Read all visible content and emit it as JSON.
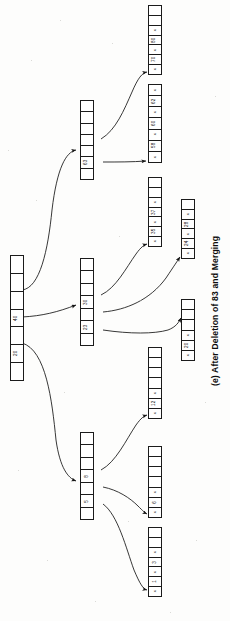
{
  "figure": {
    "caption": "(e) After Deletion of 83 and Merging",
    "kind": "b-plus-tree-diagram",
    "orientation": "rotated-90-ccw",
    "ink_color": "#1b1b1b",
    "paper_color": "#fdfdfc"
  },
  "nodes": {
    "root": {
      "name": "root-node",
      "cells": [
        {
          "type": "pointer",
          "label": ""
        },
        {
          "type": "pointer",
          "label": ""
        },
        {
          "type": "pointer",
          "label": ""
        },
        {
          "type": "key",
          "label": "40"
        },
        {
          "type": "pointer",
          "label": ""
        },
        {
          "type": "key",
          "label": "20"
        },
        {
          "type": "pointer",
          "label": ""
        }
      ]
    },
    "internal_63": {
      "name": "internal-node-63",
      "cells": [
        {
          "type": "pointer",
          "label": ""
        },
        {
          "type": "pointer",
          "label": ""
        },
        {
          "type": "pointer",
          "label": ""
        },
        {
          "type": "pointer",
          "label": ""
        },
        {
          "type": "pointer",
          "label": ""
        },
        {
          "type": "key",
          "label": "63"
        },
        {
          "type": "pointer",
          "label": ""
        }
      ]
    },
    "internal_30_23": {
      "name": "internal-node-30-23",
      "cells": [
        {
          "type": "pointer",
          "label": ""
        },
        {
          "type": "pointer",
          "label": ""
        },
        {
          "type": "pointer",
          "label": ""
        },
        {
          "type": "key",
          "label": "30"
        },
        {
          "type": "pointer",
          "label": ""
        },
        {
          "type": "key",
          "label": "23"
        },
        {
          "type": "pointer",
          "label": ""
        }
      ]
    },
    "internal_8_5": {
      "name": "internal-node-8-5",
      "cells": [
        {
          "type": "pointer",
          "label": ""
        },
        {
          "type": "pointer",
          "label": ""
        },
        {
          "type": "pointer",
          "label": ""
        },
        {
          "type": "key",
          "label": "8"
        },
        {
          "type": "pointer",
          "label": ""
        },
        {
          "type": "key",
          "label": "5"
        },
        {
          "type": "pointer",
          "label": ""
        }
      ]
    },
    "leaf_80_70": {
      "name": "leaf-node-80-70",
      "cells": [
        {
          "type": "empty",
          "label": ""
        },
        {
          "type": "empty",
          "label": ""
        },
        {
          "type": "x",
          "label": "x"
        },
        {
          "type": "key",
          "label": "80"
        },
        {
          "type": "x",
          "label": "x"
        },
        {
          "type": "key",
          "label": "70"
        },
        {
          "type": "x",
          "label": "x"
        }
      ]
    },
    "leaf_62_60_58": {
      "name": "leaf-node-62-60-58",
      "cells": [
        {
          "type": "x",
          "label": "x"
        },
        {
          "type": "key",
          "label": "62"
        },
        {
          "type": "x",
          "label": "x"
        },
        {
          "type": "key",
          "label": "60"
        },
        {
          "type": "x",
          "label": "x"
        },
        {
          "type": "key",
          "label": "58"
        },
        {
          "type": "x",
          "label": "x"
        }
      ]
    },
    "leaf_37_35": {
      "name": "leaf-node-37-35",
      "cells": [
        {
          "type": "empty",
          "label": ""
        },
        {
          "type": "empty",
          "label": ""
        },
        {
          "type": "x",
          "label": "x"
        },
        {
          "type": "key",
          "label": "37"
        },
        {
          "type": "x",
          "label": "x"
        },
        {
          "type": "key",
          "label": "35"
        },
        {
          "type": "x",
          "label": "x"
        }
      ]
    },
    "leaf_28_24": {
      "name": "leaf-node-28-24",
      "cells": [
        {
          "type": "empty",
          "label": ""
        },
        {
          "type": "x",
          "label": "x"
        },
        {
          "type": "key",
          "label": "28"
        },
        {
          "type": "x",
          "label": "x"
        },
        {
          "type": "key",
          "label": "24"
        },
        {
          "type": "x",
          "label": "x"
        }
      ]
    },
    "leaf_20": {
      "name": "leaf-node-20",
      "cells": [
        {
          "type": "empty",
          "label": ""
        },
        {
          "type": "empty",
          "label": ""
        },
        {
          "type": "empty",
          "label": ""
        },
        {
          "type": "x",
          "label": "x"
        },
        {
          "type": "key",
          "label": "20"
        },
        {
          "type": "x",
          "label": "x"
        }
      ]
    },
    "leaf_12": {
      "name": "leaf-node-12",
      "cells": [
        {
          "type": "empty",
          "label": ""
        },
        {
          "type": "empty",
          "label": ""
        },
        {
          "type": "empty",
          "label": ""
        },
        {
          "type": "empty",
          "label": ""
        },
        {
          "type": "x",
          "label": "x"
        },
        {
          "type": "key",
          "label": "12"
        },
        {
          "type": "x",
          "label": "x"
        }
      ]
    },
    "leaf_6": {
      "name": "leaf-node-6",
      "cells": [
        {
          "type": "empty",
          "label": ""
        },
        {
          "type": "empty",
          "label": ""
        },
        {
          "type": "empty",
          "label": ""
        },
        {
          "type": "empty",
          "label": ""
        },
        {
          "type": "x",
          "label": "x"
        },
        {
          "type": "key",
          "label": "6"
        },
        {
          "type": "x",
          "label": "x"
        }
      ]
    },
    "leaf_3_1": {
      "name": "leaf-node-3-1",
      "cells": [
        {
          "type": "empty",
          "label": ""
        },
        {
          "type": "empty",
          "label": ""
        },
        {
          "type": "x",
          "label": "x"
        },
        {
          "type": "key",
          "label": "3"
        },
        {
          "type": "x",
          "label": "x"
        },
        {
          "type": "key",
          "label": "1"
        },
        {
          "type": "x",
          "label": "x"
        }
      ]
    }
  },
  "tree_data": {
    "type": "b-plus-tree",
    "root_keys": [
      "40",
      "20"
    ],
    "internal_levels": [
      {
        "keys": [
          "63"
        ]
      },
      {
        "keys": [
          "30",
          "23"
        ]
      },
      {
        "keys": [
          "8",
          "5"
        ]
      }
    ],
    "leaf_key_groups": [
      [
        "80",
        "70"
      ],
      [
        "62",
        "60",
        "58"
      ],
      [
        "37",
        "35"
      ],
      [
        "28",
        "24"
      ],
      [
        "20"
      ],
      [
        "12"
      ],
      [
        "6"
      ],
      [
        "3",
        "1"
      ]
    ],
    "null_pointer_marker": "x",
    "deleted_key": "83",
    "operation": "deletion and merging"
  }
}
